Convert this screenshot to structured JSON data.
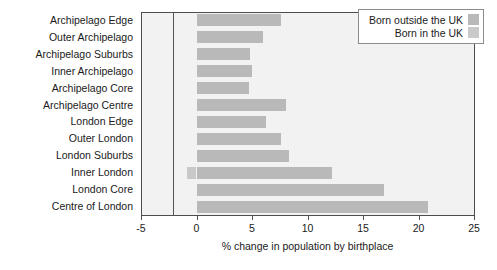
{
  "chart_data": {
    "type": "bar",
    "orientation": "horizontal",
    "title": "",
    "xlabel": "% change in population by birthplace",
    "ylabel": "",
    "xlim": [
      -5,
      25
    ],
    "xticks": [
      -5,
      0,
      5,
      10,
      15,
      20,
      25
    ],
    "xtick_labels": [
      "-5",
      "0",
      "5",
      "10",
      "15",
      "20",
      "25"
    ],
    "grid": false,
    "legend_position": "top-right",
    "categories": [
      "Archipelago Edge",
      "Outer Archipelago",
      "Archipelago Suburbs",
      "Inner Archipelago",
      "Archipelago Core",
      "Archipelago Centre",
      "London Edge",
      "Outer London",
      "London Suburbs",
      "Inner London",
      "London Core",
      "Centre of London"
    ],
    "series": [
      {
        "name": "Born outside the UK",
        "color": "#b9b9b9",
        "values": [
          7.6,
          6.0,
          4.8,
          5.0,
          4.7,
          8.1,
          6.3,
          7.6,
          8.3,
          12.2,
          16.9,
          20.9
        ]
      },
      {
        "name": "Born in the UK",
        "color": "#c9c9c9",
        "values": [
          0,
          0,
          0,
          0,
          0,
          0,
          0,
          0,
          0,
          -0.9,
          0,
          0
        ]
      }
    ],
    "values": [
      7.6,
      6.0,
      4.8,
      5.0,
      4.7,
      8.1,
      6.3,
      7.6,
      8.3,
      12.2,
      16.9,
      20.9
    ],
    "annotations": []
  },
  "legend": {
    "entries": [
      {
        "label": "Born outside the UK",
        "color": "#b9b9b9"
      },
      {
        "label": "Born in the UK",
        "color": "#c9c9c9"
      }
    ]
  },
  "colors": {
    "bar": "#b9b9b9",
    "bar_secondary": "#c9c9c9",
    "plot_background": "#f2f2f2",
    "axis": "#4d4d4d",
    "text": "#1a1a1a",
    "page_background": "#ffffff"
  }
}
